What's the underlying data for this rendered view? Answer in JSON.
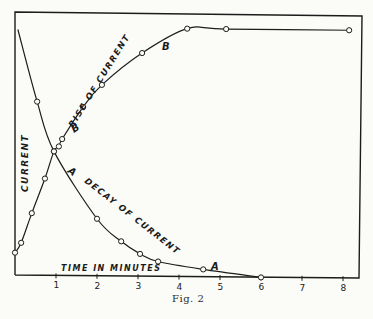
{
  "chart_data": {
    "type": "line",
    "title": "",
    "caption": "Fig. 2",
    "xlabel": "TIME IN MINUTES",
    "ylabel": "CURRENT",
    "xlim": [
      0,
      8.4
    ],
    "ylim": [
      0,
      100
    ],
    "x_ticks": [
      1,
      2,
      3,
      4,
      5,
      6,
      7,
      8
    ],
    "grid": false,
    "legend": "none (curves labeled inline)",
    "series": [
      {
        "name": "Rise of current",
        "marker_label": "B",
        "x": [
          0,
          0.15,
          0.41,
          0.73,
          0.95,
          1.07,
          1.15,
          1.66,
          2.12,
          3.1,
          4.2,
          5.15,
          8.15
        ],
        "y": [
          9,
          13,
          25,
          39,
          50,
          52,
          55,
          68,
          77,
          90,
          100,
          100,
          100
        ]
      },
      {
        "name": "Decay of current",
        "marker_label": "A",
        "x": [
          0.07,
          0.54,
          0.95,
          2.0,
          2.59,
          3.05,
          3.49,
          4.59,
          6.0
        ],
        "y": [
          99,
          70,
          50,
          23,
          14,
          9,
          6,
          3,
          0
        ]
      }
    ],
    "annotations": [
      "RISE OF CURRENT",
      "B",
      "B",
      "A",
      "DECAY OF CURRENT",
      "A",
      "CURRENT",
      "TIME IN MINUTES"
    ]
  },
  "labels": {
    "rise": "RISE OF CURRENT",
    "decay": "DECAY OF CURRENT",
    "y_axis": "CURRENT",
    "x_axis": "TIME IN MINUTES",
    "b_upper": "B",
    "b_lower": "B",
    "a_upper": "A",
    "a_lower": "A",
    "caption": "Fig. 2"
  },
  "ticks": [
    "1",
    "2",
    "3",
    "4",
    "5",
    "6",
    "7",
    "8"
  ]
}
